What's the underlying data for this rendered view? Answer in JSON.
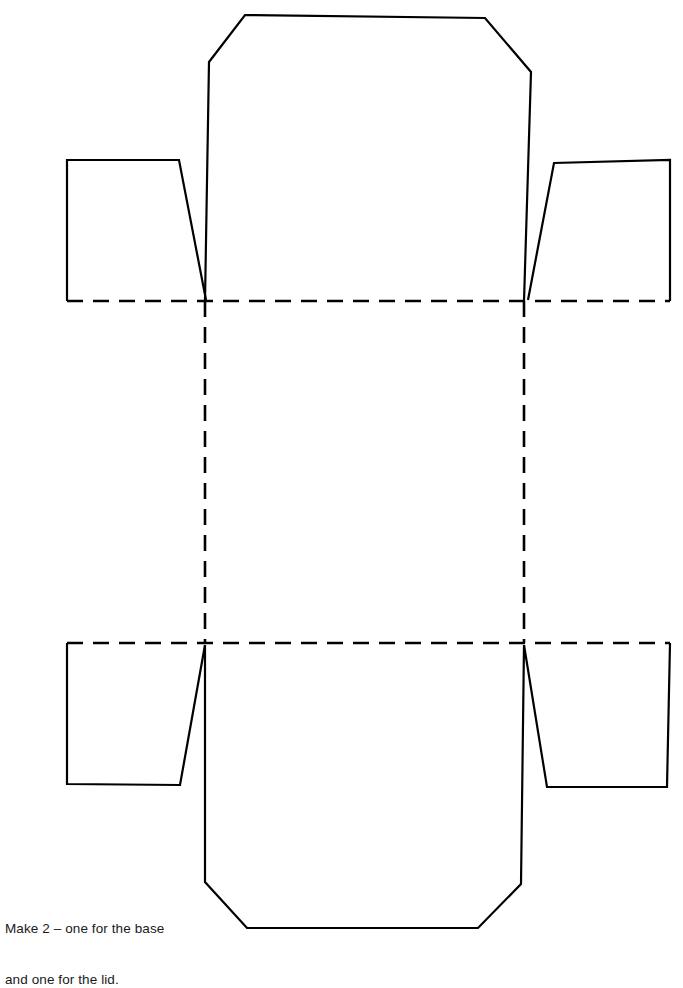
{
  "document": {
    "title": "Box net template",
    "background_color": "#ffffff",
    "line_color": "#000000",
    "width": 683,
    "height": 938
  },
  "caption": {
    "line1": "Make 2 – one for the base",
    "line2": "and one for the lid.",
    "full_text": "Make 2 – one for the base and one for the lid.",
    "color": "#1a1a1a",
    "x": 5,
    "y": 886
  },
  "diagram": {
    "name": "box-net-cut-and-fold-template",
    "cut_line_style": "solid",
    "fold_line_style": "dashed",
    "stroke_width": 2.2,
    "fold_stroke_width": 2.6,
    "fold_dash_pattern": "16 10",
    "base_panel": {
      "label": "base-panel",
      "left": 205,
      "right": 524,
      "top": 301,
      "bottom": 643
    },
    "parts": [
      {
        "name": "top-flap",
        "type": "panel-with-chamfered-corners",
        "points": "209,62 245,15 485,18 531,72 524,301 205,301"
      },
      {
        "name": "bottom-flap",
        "type": "panel-with-chamfered-corners",
        "points": "205,645 524,645 521,884 478,928 247,928 205,882"
      },
      {
        "name": "left-wall-upper-tab",
        "type": "glue-tab",
        "points": "67,160 179,160 206,300 67,301"
      },
      {
        "name": "left-wall-lower-tab",
        "type": "glue-tab",
        "points": "67,643 205,645 180,785 67,784"
      },
      {
        "name": "right-wall-upper-tab",
        "type": "glue-tab",
        "points": "528,300 554,163 670,160 670,301"
      },
      {
        "name": "right-wall-lower-tab",
        "type": "glue-tab",
        "points": "524,645 547,787 667,787 670,643"
      },
      {
        "name": "left-wall-panel",
        "type": "side-wall",
        "points": "67,301 205,301 205,643 67,643"
      },
      {
        "name": "right-wall-panel",
        "type": "side-wall",
        "points": "524,301 670,301 670,643 524,643"
      }
    ],
    "fold_lines": [
      {
        "name": "fold-line-horizontal-top",
        "x1": 67,
        "y1": 301,
        "x2": 670,
        "y2": 301
      },
      {
        "name": "fold-line-horizontal-bottom",
        "x1": 67,
        "y1": 643,
        "x2": 670,
        "y2": 643
      },
      {
        "name": "fold-line-vertical-left",
        "x1": 205,
        "y1": 301,
        "x2": 205,
        "y2": 643
      },
      {
        "name": "fold-line-vertical-right",
        "x1": 524,
        "y1": 301,
        "x2": 524,
        "y2": 643
      }
    ],
    "cut_paths": [
      {
        "name": "top-flap-outline",
        "d": "M 205 301 L 209 62 L 245 15 L 485 18 L 531 72 L 524 301"
      },
      {
        "name": "bottom-flap-outline",
        "d": "M 205 645 L 205 882 L 247 928 L 478 928 L 521 884 L 524 645"
      },
      {
        "name": "left-upper-tab-outline",
        "d": "M 67 301 L 67 160 L 179 160 L 206 300"
      },
      {
        "name": "right-upper-tab-outline",
        "d": "M 528 300 L 554 163 L 670 160 L 670 301"
      },
      {
        "name": "left-lower-tab-outline",
        "d": "M 67 643 L 67 784 L 180 785 L 205 645"
      },
      {
        "name": "right-lower-tab-outline",
        "d": "M 524 645 L 547 787 L 667 787 L 670 643"
      }
    ]
  }
}
